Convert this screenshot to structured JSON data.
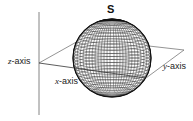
{
  "diagram": {
    "sphere_label": "S",
    "axes": {
      "z": {
        "var": "z",
        "suffix": "-axis"
      },
      "x": {
        "var": "x",
        "suffix": "-axis"
      },
      "y": {
        "var": "y",
        "suffix": "-axis"
      }
    },
    "colors": {
      "line": "#555555",
      "grid": "#222222",
      "background": "#ffffff"
    }
  }
}
